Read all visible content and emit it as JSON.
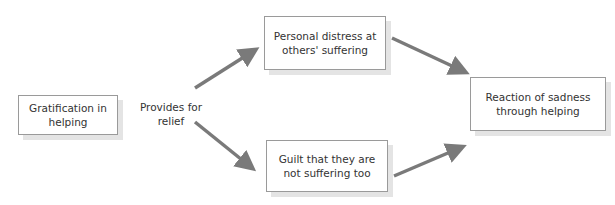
{
  "diagram": {
    "nodes": {
      "gratification": "Gratification in helping",
      "distress": "Personal distress at others' suffering",
      "guilt": "Guilt that they are not suffering too",
      "reaction": "Reaction of sadness through helping"
    },
    "edge_label": "Provides for relief",
    "edges": [
      {
        "from": "gratification",
        "to": "distress"
      },
      {
        "from": "gratification",
        "to": "guilt"
      },
      {
        "from": "distress",
        "to": "reaction"
      },
      {
        "from": "guilt",
        "to": "reaction"
      }
    ],
    "colors": {
      "arrow": "#7a7a7a",
      "border": "#9a9a9a",
      "shadow": "#e4e4e4"
    }
  }
}
